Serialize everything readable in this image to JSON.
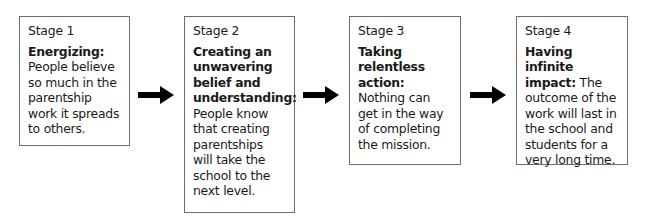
{
  "diagram": {
    "type": "process-flow",
    "stages": [
      {
        "label": "Stage 1",
        "title": "Energizing:",
        "description": "People believe so much in the parentship work it spreads to others."
      },
      {
        "label": "Stage 2",
        "title": "Creating an unwavering belief and understanding:",
        "description": "People know that creating parentships will take the school to the next level."
      },
      {
        "label": "Stage 3",
        "title": "Taking relentless action:",
        "description": "Nothing can get in the way of completing the mission."
      },
      {
        "label": "Stage 4",
        "title": "Having infinite impact:",
        "description": "The outcome of the work will last in the school and students for a very long time."
      }
    ],
    "connectors": [
      {
        "from": "Stage 1",
        "to": "Stage 2",
        "icon": "right-arrow-icon"
      },
      {
        "from": "Stage 2",
        "to": "Stage 3",
        "icon": "right-arrow-icon"
      },
      {
        "from": "Stage 3",
        "to": "Stage 4",
        "icon": "right-arrow-icon"
      }
    ],
    "colors": {
      "border": "#6e6e6e",
      "arrow": "#000000",
      "text": "#1a1a1a",
      "background": "#ffffff"
    }
  }
}
